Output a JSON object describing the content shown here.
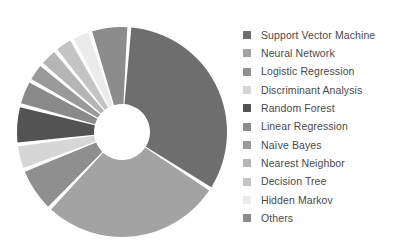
{
  "chart_data": {
    "type": "pie",
    "title": "",
    "subtitle": "",
    "xlabel": "",
    "ylabel": "",
    "variant": "donut",
    "exploded": true,
    "grid": false,
    "legend_position": "right",
    "center": {
      "x": 122,
      "y": 132
    },
    "outer_radius": 105,
    "inner_radius": 28,
    "start_angle_deg": -86,
    "gap_deg": 2.2,
    "categories": [
      "Support Vector Machine",
      "Neural Network",
      "Logistic Regression",
      "Discriminant Analysis",
      "Random Forest",
      "Linear Regression",
      "Naïve Bayes",
      "Nearest Neighbor",
      "Decision Tree",
      "Hidden Markov",
      "Others"
    ],
    "values": [
      33.0,
      28.0,
      7.0,
      4.0,
      6.0,
      4.0,
      3.0,
      3.0,
      3.0,
      3.0,
      6.0
    ],
    "colors": [
      "#6e6e6e",
      "#a3a3a3",
      "#8f8f8f",
      "#d6d6d6",
      "#535353",
      "#8a8a8a",
      "#9a9a9a",
      "#b5b5b5",
      "#c4c4c4",
      "#ebebeb",
      "#8c8c8c"
    ]
  },
  "legend": {
    "items": [
      {
        "label": "Support Vector Machine",
        "color": "#6e6e6e"
      },
      {
        "label": "Neural Network",
        "color": "#a3a3a3"
      },
      {
        "label": "Logistic Regression",
        "color": "#8f8f8f"
      },
      {
        "label": "Discriminant Analysis",
        "color": "#d6d6d6"
      },
      {
        "label": "Random Forest",
        "color": "#535353"
      },
      {
        "label": "Linear Regression",
        "color": "#8a8a8a"
      },
      {
        "label": "Naïve Bayes",
        "color": "#9a9a9a"
      },
      {
        "label": "Nearest Neighbor",
        "color": "#b5b5b5"
      },
      {
        "label": "Decision Tree",
        "color": "#c4c4c4"
      },
      {
        "label": "Hidden Markov",
        "color": "#ebebeb"
      },
      {
        "label": "Others",
        "color": "#8c8c8c"
      }
    ]
  },
  "theme": {
    "background": "#ffffff",
    "text_color": "#4a4a4a",
    "slice_gap_color": "#ffffff"
  }
}
